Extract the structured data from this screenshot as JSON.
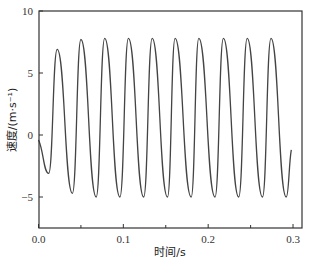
{
  "chart_data": {
    "type": "line",
    "title": "",
    "xlabel": "时间/s",
    "ylabel": "速度/(m·s⁻¹)",
    "xlim": [
      0.0,
      0.31
    ],
    "ylim": [
      -7.5,
      10
    ],
    "xticks": [
      0.0,
      0.1,
      0.2,
      0.3
    ],
    "xtick_labels": [
      "0.0",
      "0.1",
      "0.2",
      "0.3"
    ],
    "xminor_ticks": [
      0.05,
      0.15,
      0.25
    ],
    "yticks": [
      10,
      5,
      0,
      -5
    ],
    "ytick_labels": [
      "10",
      "5",
      "0",
      "−5"
    ],
    "grid": false,
    "legend": null,
    "series": [
      {
        "name": "velocity",
        "color": "#444444",
        "x": [
          0.0,
          0.012,
          0.022,
          0.04,
          0.05,
          0.068,
          0.078,
          0.096,
          0.106,
          0.124,
          0.134,
          0.152,
          0.161,
          0.18,
          0.189,
          0.208,
          0.218,
          0.236,
          0.246,
          0.264,
          0.274,
          0.292,
          0.298
        ],
        "y": [
          -0.4,
          -3.1,
          6.9,
          -4.7,
          7.7,
          -5.0,
          7.8,
          -5.0,
          7.8,
          -5.0,
          7.8,
          -5.0,
          7.8,
          -5.0,
          7.8,
          -5.0,
          7.8,
          -5.0,
          7.8,
          -5.0,
          7.8,
          -5.0,
          -1.2
        ]
      }
    ]
  },
  "labels": {
    "xlabel": "时间/s",
    "ylabel": "速度/(m·s⁻¹)"
  }
}
